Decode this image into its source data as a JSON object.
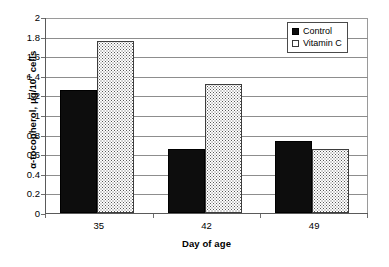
{
  "chart_data": {
    "type": "bar",
    "title": "",
    "subtitle": "",
    "xlabel": "Day of age",
    "ylabel": "α-tocopherol, μg/10⁷ cells",
    "ylabel_parts": {
      "prefix": "α-tocopherol, μg/10",
      "superscript": "7",
      "suffix": " cells"
    },
    "categories": [
      "35",
      "42",
      "49"
    ],
    "series": [
      {
        "name": "Control",
        "values": [
          1.26,
          0.65,
          0.73
        ],
        "color": "#0d0d0d",
        "pattern": "solid-black"
      },
      {
        "name": "Vitamin C",
        "values": [
          1.76,
          1.32,
          0.65
        ],
        "color": "#ffffff",
        "pattern": "fine-dotted"
      }
    ],
    "ylim": [
      0,
      2
    ],
    "ytick_step": 0.2,
    "ytick_labels": [
      "0",
      "0.2",
      "0.4",
      "0.6",
      "0.8",
      "1",
      "1.2",
      "1.4",
      "1.6",
      "1.8",
      "2"
    ],
    "ytick_values": [
      0,
      0.2,
      0.4,
      0.6,
      0.8,
      1,
      1.2,
      1.4,
      1.6,
      1.8,
      2
    ],
    "grid": true,
    "grid_axis": "y",
    "legend_position": "top-right",
    "legend_entries": [
      "Control",
      "Vitamin C"
    ],
    "plot_background": "#ffffff",
    "gridline_color": "#8d8d8d",
    "axis_color": "#5a5a5a"
  },
  "legend": {
    "items": [
      {
        "label": "Control",
        "swatch": "filled-square-black"
      },
      {
        "label": "Vitamin C",
        "swatch": "open-square-dotted"
      }
    ]
  }
}
